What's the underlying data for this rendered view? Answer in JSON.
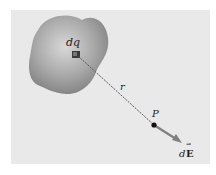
{
  "figure": {
    "charge_element_label": "dq",
    "distance_label": "r",
    "point_label": "P",
    "field_label_prefix": "d",
    "field_label_vector": "E",
    "field_vector_mark": "→"
  },
  "colors": {
    "panel": "#e9e9e9",
    "blob": "#9a9a9a",
    "line": "#555555",
    "point": "#111111",
    "arrow": "#7a7a7a"
  }
}
